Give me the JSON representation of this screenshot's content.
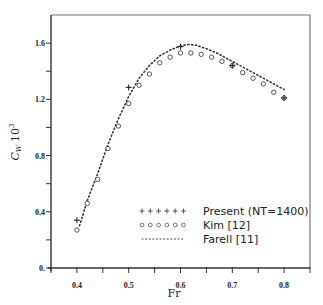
{
  "chart_data": {
    "type": "scatter",
    "title": "",
    "xlabel": "Fr",
    "ylabel": "C_W 10^3",
    "xlim": [
      0.35,
      0.85
    ],
    "ylim": [
      0.0,
      1.8
    ],
    "x_ticks": [
      0.35,
      0.4,
      0.45,
      0.5,
      0.55,
      0.6,
      0.65,
      0.7,
      0.75,
      0.8,
      0.85
    ],
    "x_tick_labels": [
      "0.4",
      "0.5",
      "0.6",
      "0.7",
      "0.8"
    ],
    "x_tick_label_values": [
      0.4,
      0.5,
      0.6,
      0.7,
      0.8
    ],
    "y_ticks": [
      0.0,
      0.2,
      0.4,
      0.6,
      0.8,
      1.0,
      1.2,
      1.4,
      1.6
    ],
    "y_tick_labels": [
      "0.",
      "0.4",
      "0.8",
      "1.2",
      "1.6"
    ],
    "y_tick_label_values": [
      0.0,
      0.4,
      0.8,
      1.2,
      1.6
    ],
    "grid": false,
    "legend_position": "lower right",
    "series": [
      {
        "name": "Present (NT=1400)",
        "marker": "plus",
        "x": [
          0.4,
          0.5,
          0.6,
          0.7,
          0.8
        ],
        "y": [
          0.34,
          1.285,
          1.575,
          1.44,
          1.21
        ]
      },
      {
        "name": "Kim [12]",
        "marker": "circle",
        "x": [
          0.4,
          0.42,
          0.44,
          0.46,
          0.48,
          0.5,
          0.52,
          0.54,
          0.56,
          0.58,
          0.6,
          0.62,
          0.64,
          0.66,
          0.68,
          0.7,
          0.72,
          0.74,
          0.76,
          0.78,
          0.8
        ],
        "y": [
          0.27,
          0.46,
          0.63,
          0.85,
          1.01,
          1.17,
          1.3,
          1.38,
          1.46,
          1.5,
          1.53,
          1.53,
          1.52,
          1.5,
          1.47,
          1.44,
          1.39,
          1.35,
          1.31,
          1.25,
          1.21
        ]
      },
      {
        "name": "Farell [11]",
        "marker": "dotted-line",
        "x": [
          0.405,
          0.42,
          0.44,
          0.46,
          0.48,
          0.5,
          0.52,
          0.54,
          0.56,
          0.58,
          0.6,
          0.615,
          0.63,
          0.65,
          0.67,
          0.69,
          0.71,
          0.73,
          0.75,
          0.77,
          0.79,
          0.8
        ],
        "y": [
          0.3,
          0.48,
          0.67,
          0.88,
          1.06,
          1.22,
          1.35,
          1.44,
          1.51,
          1.55,
          1.58,
          1.59,
          1.585,
          1.56,
          1.53,
          1.49,
          1.45,
          1.41,
          1.37,
          1.33,
          1.29,
          1.27
        ]
      }
    ]
  },
  "legend": {
    "items": [
      {
        "label": "Present (NT=1400)",
        "symbol": "+ + + + + +"
      },
      {
        "label": "Kim [12]",
        "symbol": "o o o o o o"
      },
      {
        "label": "Farell [11]",
        "symbol": "............"
      }
    ]
  },
  "axes": {
    "x_title": "Fr",
    "y_title_main": "C",
    "y_title_sub": "W",
    "y_title_factor": "10",
    "y_title_exp": "3"
  }
}
